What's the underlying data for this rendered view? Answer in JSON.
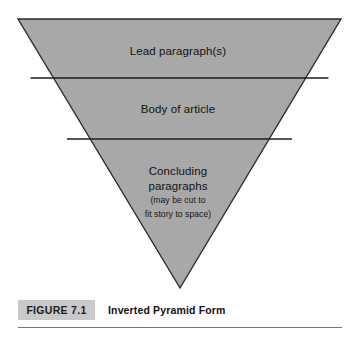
{
  "figure": {
    "number_label": "FIGURE 7.1",
    "title": "Inverted Pyramid Form"
  },
  "diagram": {
    "type": "inverted-pyramid",
    "shape": {
      "top_left": [
        18,
        19
      ],
      "top_right": [
        341,
        19
      ],
      "apex": [
        180,
        288
      ],
      "fill_color": "#a8a8a8",
      "stroke_color": "#2b2b2b",
      "divider_color": "#1e1e1e",
      "divider_y": [
        78,
        139
      ]
    },
    "bands": [
      {
        "id": "lead",
        "label": "Lead paragraph(s)"
      },
      {
        "id": "body",
        "label": "Body of article"
      },
      {
        "id": "concluding",
        "label_line1": "Concluding",
        "label_line2": "paragraphs",
        "note_line1": "(may be cut to",
        "note_line2": "fit story to space)"
      }
    ]
  },
  "colors": {
    "page_background": "#ffffff",
    "pyramid_fill": "#a8a8a8",
    "caption_box": "#c9c9c9",
    "rule": "#6e7478"
  }
}
